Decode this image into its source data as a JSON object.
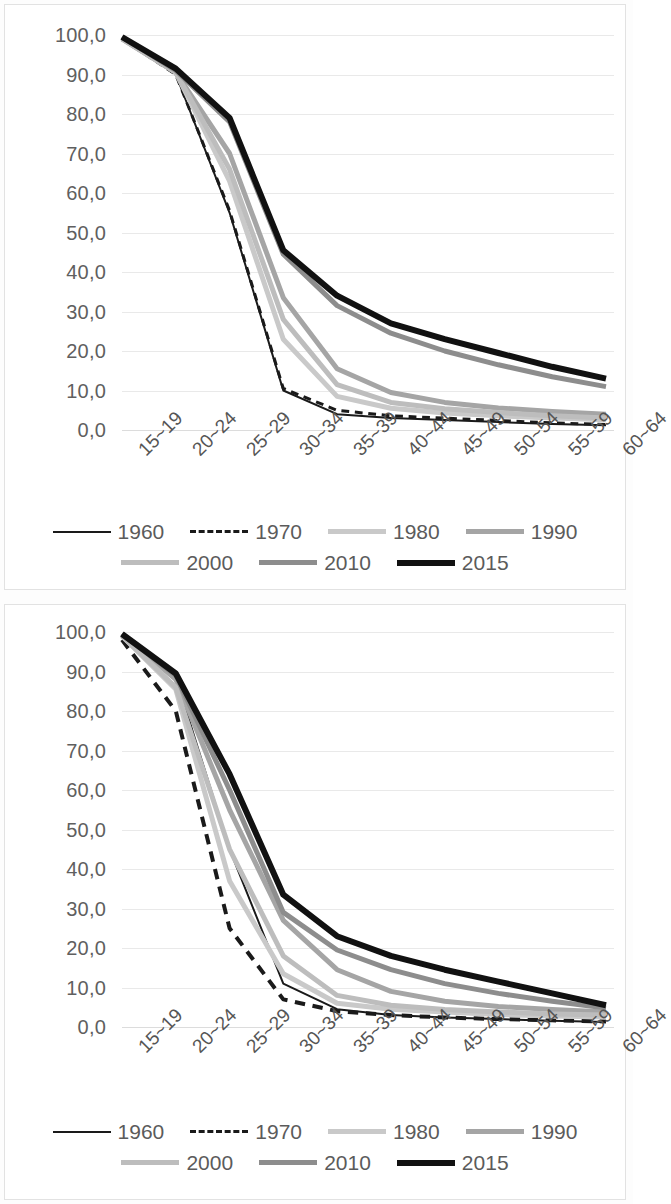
{
  "page": {
    "background": "#ffffff",
    "axis_text_color": "#5f5f5f",
    "gridline_color": "#e9e9e9"
  },
  "axis": {
    "y_ticks": [
      "100,0",
      "90,0",
      "80,0",
      "70,0",
      "60,0",
      "50,0",
      "40,0",
      "30,0",
      "20,0",
      "10,0",
      "0,0"
    ],
    "x_ticks": [
      "15~19",
      "20~24",
      "25~29",
      "30~34",
      "35~39",
      "40~44",
      "45~49",
      "50~54",
      "55~59",
      "60~64"
    ]
  },
  "legend": {
    "rows": [
      [
        {
          "label": "1960",
          "color": "#1a1a1a",
          "width": 2,
          "dash": "none"
        },
        {
          "label": "1970",
          "color": "#1a1a1a",
          "width": 3,
          "dash": "dashed"
        },
        {
          "label": "1980",
          "color": "#c9c9c9",
          "width": 5,
          "dash": "none"
        },
        {
          "label": "1990",
          "color": "#a5a5a5",
          "width": 5,
          "dash": "none"
        }
      ],
      [
        {
          "label": "2000",
          "color": "#bdbdbd",
          "width": 5,
          "dash": "none"
        },
        {
          "label": "2010",
          "color": "#8d8d8d",
          "width": 5,
          "dash": "none"
        },
        {
          "label": "2015",
          "color": "#111111",
          "width": 6,
          "dash": "none"
        }
      ]
    ]
  },
  "chart_data": [
    {
      "type": "line",
      "title": "",
      "xlabel": "",
      "ylabel": "",
      "ylim": [
        0,
        100
      ],
      "ytick_step": 10,
      "grid": true,
      "legend_position": "bottom",
      "categories": [
        "15~19",
        "20~24",
        "25~29",
        "30~34",
        "35~39",
        "40~44",
        "45~49",
        "50~54",
        "55~59",
        "60~64"
      ],
      "series": [
        {
          "name": "1960",
          "color": "#1a1a1a",
          "width": 2,
          "dash": "none",
          "values": [
            99.0,
            90.0,
            55.0,
            10.0,
            4.0,
            3.0,
            2.5,
            2.0,
            1.5,
            1.2
          ]
        },
        {
          "name": "1970",
          "color": "#1a1a1a",
          "width": 3,
          "dash": "dashed",
          "values": [
            99.0,
            90.0,
            55.5,
            10.5,
            5.0,
            3.6,
            3.0,
            2.4,
            1.8,
            1.4
          ]
        },
        {
          "name": "1980",
          "color": "#c9c9c9",
          "width": 5,
          "dash": "none",
          "values": [
            99.0,
            90.5,
            63.0,
            23.0,
            8.5,
            5.5,
            4.3,
            3.6,
            3.0,
            2.6
          ]
        },
        {
          "name": "1990",
          "color": "#a5a5a5",
          "width": 5,
          "dash": "none",
          "values": [
            99.0,
            90.5,
            70.0,
            33.5,
            15.5,
            9.5,
            7.0,
            5.6,
            4.7,
            4.0
          ]
        },
        {
          "name": "2000",
          "color": "#bdbdbd",
          "width": 5,
          "dash": "none",
          "values": [
            99.0,
            90.5,
            66.0,
            28.0,
            11.5,
            7.0,
            5.4,
            4.4,
            3.6,
            3.0
          ]
        },
        {
          "name": "2010",
          "color": "#8d8d8d",
          "width": 5,
          "dash": "none",
          "values": [
            99.5,
            91.0,
            78.0,
            44.5,
            31.5,
            24.5,
            20.0,
            16.5,
            13.5,
            11.0
          ]
        },
        {
          "name": "2015",
          "color": "#111111",
          "width": 6,
          "dash": "none",
          "values": [
            99.5,
            91.5,
            79.0,
            45.5,
            34.0,
            27.0,
            23.0,
            19.5,
            16.0,
            13.0
          ]
        }
      ]
    },
    {
      "type": "line",
      "title": "",
      "xlabel": "",
      "ylabel": "",
      "ylim": [
        0,
        100
      ],
      "ytick_step": 10,
      "grid": true,
      "legend_position": "bottom",
      "categories": [
        "15~19",
        "20~24",
        "25~29",
        "30~34",
        "35~39",
        "40~44",
        "45~49",
        "50~54",
        "55~59",
        "60~64"
      ],
      "series": [
        {
          "name": "1960",
          "color": "#1a1a1a",
          "width": 2,
          "dash": "none",
          "values": [
            99.5,
            88.5,
            45.0,
            11.0,
            4.5,
            3.0,
            2.4,
            2.0,
            1.6,
            1.3
          ]
        },
        {
          "name": "1970",
          "color": "#1a1a1a",
          "width": 4,
          "dash": "dashed",
          "values": [
            98.0,
            80.0,
            25.0,
            7.0,
            4.0,
            3.0,
            2.4,
            2.0,
            1.7,
            1.4
          ]
        },
        {
          "name": "1980",
          "color": "#c9c9c9",
          "width": 5,
          "dash": "none",
          "values": [
            99.0,
            85.5,
            37.0,
            13.5,
            6.0,
            4.5,
            3.8,
            3.2,
            2.8,
            2.5
          ]
        },
        {
          "name": "1990",
          "color": "#a5a5a5",
          "width": 5,
          "dash": "none",
          "values": [
            99.5,
            88.0,
            55.0,
            27.0,
            14.5,
            9.0,
            6.5,
            5.2,
            4.4,
            3.8
          ]
        },
        {
          "name": "2000",
          "color": "#bdbdbd",
          "width": 5,
          "dash": "none",
          "values": [
            99.0,
            86.0,
            45.0,
            18.0,
            8.0,
            5.5,
            4.4,
            3.8,
            3.3,
            3.0
          ]
        },
        {
          "name": "2010",
          "color": "#8d8d8d",
          "width": 5,
          "dash": "none",
          "values": [
            99.5,
            89.0,
            60.0,
            29.0,
            19.5,
            14.5,
            11.0,
            8.5,
            6.5,
            4.8
          ]
        },
        {
          "name": "2015",
          "color": "#111111",
          "width": 6,
          "dash": "none",
          "values": [
            99.5,
            89.5,
            64.0,
            33.5,
            23.0,
            18.0,
            14.5,
            11.5,
            8.5,
            5.5
          ]
        }
      ]
    }
  ]
}
